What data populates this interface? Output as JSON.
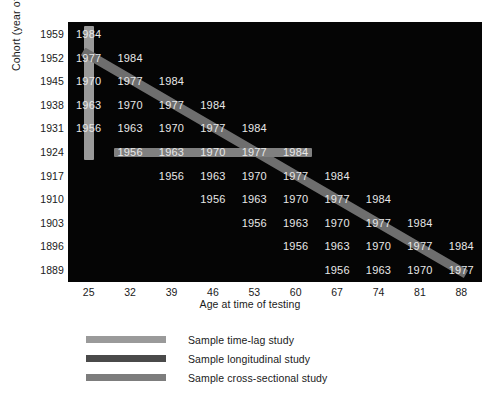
{
  "chart_data": {
    "type": "table",
    "title": "",
    "xlabel": "Age at time of testing",
    "ylabel": "Cohort (year of birth)",
    "grid": false,
    "legend_position": "below",
    "ages": [
      25,
      32,
      39,
      46,
      53,
      60,
      67,
      74,
      81,
      88
    ],
    "cohorts": [
      1959,
      1952,
      1945,
      1938,
      1931,
      1924,
      1917,
      1910,
      1903,
      1896,
      1889
    ],
    "testing_years": [
      [
        "1984",
        "",
        "",
        "",
        "",
        "",
        "",
        "",
        "",
        ""
      ],
      [
        "1977",
        "1984",
        "",
        "",
        "",
        "",
        "",
        "",
        "",
        ""
      ],
      [
        "1970",
        "1977",
        "1984",
        "",
        "",
        "",
        "",
        "",
        "",
        ""
      ],
      [
        "1963",
        "1970",
        "1977",
        "1984",
        "",
        "",
        "",
        "",
        "",
        ""
      ],
      [
        "1956",
        "1963",
        "1970",
        "1977",
        "1984",
        "",
        "",
        "",
        "",
        ""
      ],
      [
        "",
        "1956",
        "1963",
        "1970",
        "1977",
        "1984",
        "",
        "",
        "",
        ""
      ],
      [
        "",
        "",
        "1956",
        "1963",
        "1970",
        "1977",
        "1984",
        "",
        "",
        ""
      ],
      [
        "",
        "",
        "",
        "1956",
        "1963",
        "1970",
        "1977",
        "1984",
        "",
        ""
      ],
      [
        "",
        "",
        "",
        "",
        "1956",
        "1963",
        "1970",
        "1977",
        "1984",
        ""
      ],
      [
        "",
        "",
        "",
        "",
        "",
        "1956",
        "1963",
        "1970",
        "1977",
        "1984"
      ],
      [
        "",
        "",
        "",
        "",
        "",
        "",
        "1956",
        "1963",
        "1970",
        "1977"
      ]
    ],
    "highlights": [
      {
        "name": "time-lag",
        "orientation": "vertical",
        "color": "#9a9a9a",
        "age": 25,
        "cohort_start": 1959,
        "cohort_end": 1924
      },
      {
        "name": "longitudinal",
        "orientation": "diagonal",
        "color": "#6e6e6e",
        "age_start": 25,
        "age_end": 88,
        "cohort_start": 1952,
        "cohort_end": 1889
      },
      {
        "name": "cross-sectional",
        "orientation": "horizontal",
        "color": "#808080",
        "cohort": 1924,
        "age_start": 32,
        "age_end": 60
      }
    ],
    "panel_background": "#050505",
    "cell_text_color": "#e8e8e8"
  },
  "axes": {
    "y_title": "Cohort (year of  birth)",
    "x_title": "Age at time of testing",
    "y_ticks": [
      "1959",
      "1952",
      "1945",
      "1938",
      "1931",
      "1924",
      "1917",
      "1910",
      "1903",
      "1896",
      "1889"
    ],
    "x_ticks": [
      "25",
      "32",
      "39",
      "46",
      "53",
      "60",
      "67",
      "74",
      "81",
      "88"
    ]
  },
  "legend": {
    "items": [
      {
        "label": "Sample time-lag study",
        "color": "#9a9a9a"
      },
      {
        "label": "Sample longitudinal study",
        "color": "#4a4a4a"
      },
      {
        "label": "Sample cross-sectional study",
        "color": "#7d7d7d"
      }
    ]
  }
}
